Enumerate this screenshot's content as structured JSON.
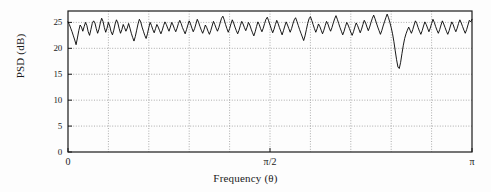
{
  "figure": {
    "ylabel": "PSD (dB)",
    "xlabel": "Frequency (θ)",
    "yticks": [
      "0",
      "5",
      "10",
      "15",
      "20",
      "25"
    ],
    "xticks": [
      "0",
      "π/2",
      "π"
    ],
    "line_color": "#000000",
    "grid_color": "#8a8a8a",
    "axis_color": "#1a1a1a",
    "background": "#fdfdfd"
  },
  "chart_data": {
    "type": "line",
    "title": "",
    "xlabel": "Frequency (θ)",
    "ylabel": "PSD (dB)",
    "xlim": [
      0,
      3.14159
    ],
    "ylim": [
      0,
      27.2
    ],
    "xtick_values": [
      0,
      1.5708,
      3.14159
    ],
    "xtick_labels": [
      "0",
      "π/2",
      "π"
    ],
    "ytick_values": [
      0,
      5,
      10,
      15,
      20,
      25
    ],
    "ytick_labels": [
      "0",
      "5",
      "10",
      "15",
      "20",
      "25"
    ],
    "grid": true,
    "grid_x_divisions": 10,
    "legend": null,
    "annotations": [
      {
        "text": "deep notch",
        "x": 2.47,
        "y": 16.1
      }
    ],
    "series": [
      {
        "name": "PSD",
        "x": [
          0.0,
          0.0105,
          0.0209,
          0.0314,
          0.0419,
          0.0524,
          0.0628,
          0.0733,
          0.0838,
          0.0942,
          0.1047,
          0.1152,
          0.1257,
          0.1361,
          0.1466,
          0.1571,
          0.1676,
          0.178,
          0.1885,
          0.199,
          0.2094,
          0.2199,
          0.2304,
          0.2409,
          0.2513,
          0.2618,
          0.2723,
          0.2827,
          0.2932,
          0.3037,
          0.3142,
          0.3246,
          0.3351,
          0.3456,
          0.3561,
          0.3665,
          0.377,
          0.3875,
          0.3979,
          0.4084,
          0.4189,
          0.4294,
          0.4398,
          0.4503,
          0.4608,
          0.4712,
          0.4817,
          0.4922,
          0.5027,
          0.5131,
          0.5236,
          0.5341,
          0.5445,
          0.555,
          0.5655,
          0.576,
          0.5864,
          0.5969,
          0.6074,
          0.6178,
          0.6283,
          0.6388,
          0.6493,
          0.6597,
          0.6702,
          0.6807,
          0.6912,
          0.7016,
          0.7121,
          0.7226,
          0.733,
          0.7435,
          0.754,
          0.7645,
          0.7749,
          0.7854,
          0.7959,
          0.8063,
          0.8168,
          0.8273,
          0.8378,
          0.8482,
          0.8587,
          0.8692,
          0.8796,
          0.8901,
          0.9006,
          0.9111,
          0.9215,
          0.932,
          0.9425,
          0.9529,
          0.9634,
          0.9739,
          0.9844,
          0.9948,
          1.0053,
          1.0158,
          1.0262,
          1.0367,
          1.0472,
          1.0577,
          1.0681,
          1.0786,
          1.0891,
          1.0996,
          1.11,
          1.1205,
          1.131,
          1.1414,
          1.1519,
          1.1624,
          1.1729,
          1.1833,
          1.1938,
          1.2043,
          1.2147,
          1.2252,
          1.2357,
          1.2462,
          1.2566,
          1.2671,
          1.2776,
          1.288,
          1.2985,
          1.309,
          1.3195,
          1.3299,
          1.3404,
          1.3509,
          1.3614,
          1.3718,
          1.3823,
          1.3928,
          1.4032,
          1.4137,
          1.4242,
          1.4347,
          1.4451,
          1.4556,
          1.4661,
          1.4765,
          1.487,
          1.4975,
          1.508,
          1.5184,
          1.5289,
          1.5394,
          1.5499,
          1.5603,
          1.5708,
          1.5813,
          1.5917,
          1.6022,
          1.6127,
          1.6232,
          1.6336,
          1.6441,
          1.6546,
          1.665,
          1.6755,
          1.686,
          1.6965,
          1.7069,
          1.7174,
          1.7279,
          1.7384,
          1.7488,
          1.7593,
          1.7698,
          1.7802,
          1.7907,
          1.8012,
          1.8117,
          1.8221,
          1.8326,
          1.8431,
          1.8535,
          1.864,
          1.8745,
          1.885,
          1.8954,
          1.9059,
          1.9164,
          1.9268,
          1.9373,
          1.9478,
          1.9583,
          1.9687,
          1.9792,
          1.9897,
          2.0002,
          2.0106,
          2.0211,
          2.0316,
          2.042,
          2.0525,
          2.063,
          2.0735,
          2.0839,
          2.0944,
          2.1049,
          2.1153,
          2.1258,
          2.1363,
          2.1468,
          2.1572,
          2.1677,
          2.1782,
          2.1887,
          2.1991,
          2.2096,
          2.2201,
          2.2305,
          2.241,
          2.2515,
          2.262,
          2.2724,
          2.2829,
          2.2934,
          2.3038,
          2.3143,
          2.3248,
          2.3353,
          2.3457,
          2.3562,
          2.3667,
          2.3771,
          2.3876,
          2.3981,
          2.4086,
          2.419,
          2.4295,
          2.44,
          2.4504,
          2.4609,
          2.4714,
          2.4819,
          2.4923,
          2.5028,
          2.5133,
          2.5238,
          2.5342,
          2.5447,
          2.5552,
          2.5656,
          2.5761,
          2.5866,
          2.5971,
          2.6075,
          2.618,
          2.6285,
          2.6389,
          2.6494,
          2.6599,
          2.6704,
          2.6808,
          2.6913,
          2.7018,
          2.7122,
          2.7227,
          2.7332,
          2.7437,
          2.7541,
          2.7646,
          2.7751,
          2.7855,
          2.796,
          2.8065,
          2.817,
          2.8274,
          2.8379,
          2.8484,
          2.8588,
          2.8693,
          2.8798,
          2.8903,
          2.9007,
          2.9112,
          2.9217,
          2.9322,
          2.9426,
          2.9531,
          2.9636,
          2.974,
          2.9845,
          2.995,
          3.0055,
          3.0159,
          3.0264,
          3.0369,
          3.0473,
          3.0578,
          3.0683,
          3.0788,
          3.0892,
          3.0997,
          3.1102,
          3.1206,
          3.1311,
          3.1416
        ],
        "y": [
          25.1,
          24.6,
          23.9,
          23.2,
          22.4,
          21.6,
          20.7,
          22.0,
          23.4,
          24.5,
          24.1,
          23.3,
          24.2,
          25.0,
          24.4,
          23.2,
          22.5,
          23.6,
          24.8,
          25.3,
          24.9,
          23.8,
          22.9,
          23.7,
          24.9,
          25.8,
          25.2,
          24.0,
          23.1,
          23.9,
          25.0,
          24.3,
          23.2,
          22.6,
          23.5,
          24.7,
          25.5,
          24.9,
          23.8,
          22.9,
          23.6,
          24.6,
          24.0,
          23.3,
          23.9,
          24.8,
          23.9,
          22.9,
          22.1,
          21.4,
          22.3,
          23.5,
          24.7,
          25.6,
          25.1,
          24.1,
          23.3,
          22.5,
          21.9,
          22.8,
          24.0,
          25.0,
          24.4,
          23.6,
          23.0,
          23.8,
          24.6,
          24.1,
          23.4,
          22.8,
          23.5,
          24.4,
          25.1,
          24.6,
          23.9,
          23.3,
          24.1,
          25.0,
          24.5,
          23.8,
          23.2,
          23.9,
          24.8,
          25.4,
          24.8,
          24.0,
          23.4,
          22.8,
          23.6,
          24.5,
          25.3,
          24.7,
          23.9,
          23.2,
          23.8,
          24.7,
          25.6,
          25.0,
          24.2,
          23.5,
          22.9,
          23.6,
          24.5,
          24.0,
          23.3,
          22.7,
          23.4,
          24.3,
          25.2,
          24.6,
          23.9,
          23.3,
          24.0,
          24.9,
          25.8,
          26.2,
          25.5,
          24.6,
          23.8,
          23.1,
          23.8,
          24.7,
          25.5,
          24.9,
          24.1,
          23.4,
          22.8,
          23.5,
          24.4,
          25.2,
          24.7,
          24.0,
          23.4,
          24.1,
          25.0,
          24.5,
          23.7,
          23.0,
          22.4,
          23.2,
          24.2,
          25.1,
          24.6,
          23.8,
          23.2,
          23.9,
          24.8,
          25.6,
          26.0,
          25.3,
          24.5,
          23.7,
          23.0,
          23.7,
          24.6,
          25.4,
          24.8,
          24.0,
          23.3,
          22.6,
          23.4,
          24.3,
          25.1,
          24.5,
          23.8,
          23.1,
          23.8,
          24.7,
          25.5,
          25.9,
          25.2,
          24.4,
          23.6,
          22.9,
          22.2,
          21.5,
          22.4,
          23.6,
          24.8,
          25.7,
          26.1,
          25.4,
          24.6,
          23.8,
          23.1,
          23.8,
          24.7,
          24.2,
          23.5,
          22.8,
          23.5,
          24.4,
          25.2,
          24.7,
          23.9,
          23.3,
          24.0,
          24.9,
          25.7,
          26.3,
          25.6,
          24.8,
          24.0,
          23.3,
          22.6,
          23.3,
          24.2,
          25.0,
          24.5,
          23.8,
          23.1,
          22.5,
          23.2,
          24.1,
          24.9,
          24.4,
          23.7,
          23.0,
          23.7,
          24.6,
          25.4,
          24.9,
          24.1,
          23.4,
          24.1,
          25.0,
          25.8,
          26.4,
          25.7,
          24.9,
          24.1,
          23.4,
          22.7,
          23.4,
          24.3,
          25.1,
          25.9,
          26.6,
          25.9,
          25.0,
          24.0,
          22.8,
          21.3,
          19.5,
          17.8,
          16.4,
          16.1,
          17.3,
          19.0,
          20.6,
          21.9,
          22.8,
          23.5,
          24.1,
          23.5,
          22.9,
          23.6,
          24.5,
          25.3,
          24.8,
          24.0,
          23.3,
          22.7,
          23.4,
          24.3,
          25.1,
          24.6,
          23.9,
          23.2,
          23.9,
          24.8,
          25.6,
          25.0,
          24.2,
          23.5,
          22.9,
          23.6,
          24.5,
          25.3,
          24.7,
          24.0,
          23.3,
          22.7,
          23.4,
          24.3,
          25.1,
          24.6,
          23.8,
          23.2,
          23.9,
          24.8,
          25.5,
          24.9,
          24.2,
          23.5,
          22.9,
          23.6,
          24.5,
          25.4,
          25.1,
          25.6
        ]
      }
    ]
  }
}
